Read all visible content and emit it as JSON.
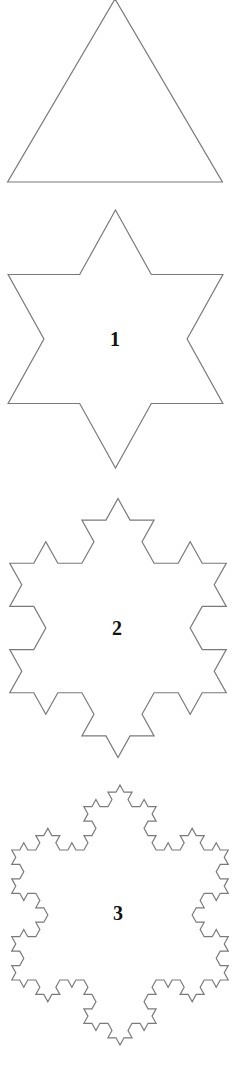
{
  "colors": {
    "stroke": "#7a7a7a",
    "label": "#111111",
    "background": "#ffffff"
  },
  "figures": [
    {
      "name": "koch-iteration-0",
      "label": "",
      "level": 0,
      "cx": 115,
      "cy": 121,
      "rx": 124,
      "ry": 122
    },
    {
      "name": "koch-iteration-1",
      "label": "1",
      "level": 1,
      "cx": 115.5,
      "cy": 339,
      "rx": 124,
      "ry": 129,
      "label_x": 115,
      "label_y": 339
    },
    {
      "name": "koch-iteration-2",
      "label": "2",
      "level": 2,
      "cx": 118,
      "cy": 628,
      "rx": 125,
      "ry": 129.5,
      "label_x": 117,
      "label_y": 628
    },
    {
      "name": "koch-iteration-3",
      "label": "3",
      "level": 3,
      "cx": 120,
      "cy": 915,
      "rx": 125,
      "ry": 130,
      "label_x": 118,
      "label_y": 913
    }
  ]
}
